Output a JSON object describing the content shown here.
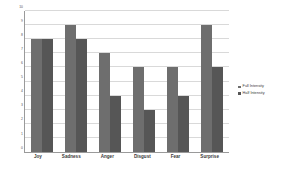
{
  "chart_data": {
    "type": "bar",
    "title": "",
    "xlabel": "",
    "ylabel": "",
    "categories": [
      "Joy",
      "Sadness",
      "Anger",
      "Disgust",
      "Fear",
      "Surprise"
    ],
    "series": [
      {
        "name": "Full Intensity",
        "color": "#6e6e6e",
        "values": [
          8,
          9,
          7,
          6,
          6,
          9
        ]
      },
      {
        "name": "Half Intensity",
        "color": "#565656",
        "values": [
          8,
          8,
          4,
          3,
          4,
          6
        ]
      }
    ],
    "ylim": [
      0,
      10
    ],
    "yticks": [
      0,
      1,
      2,
      3,
      4,
      5,
      6,
      7,
      8,
      9,
      10
    ],
    "ytick_labels": [
      "0",
      "1",
      "2",
      "3",
      "4",
      "5",
      "6",
      "7",
      "8",
      "9",
      "10"
    ],
    "grid": true,
    "legend_position": "right"
  }
}
